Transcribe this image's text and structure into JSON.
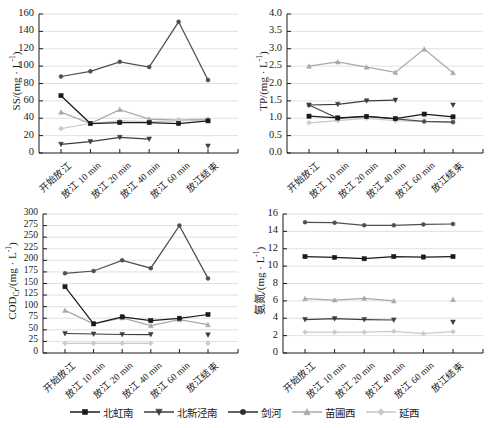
{
  "figure": {
    "panel_count": 4,
    "categories": [
      "开始放江",
      "放江 10 min",
      "放江 20 min",
      "放江 40 min",
      "放江 60 min",
      "放江结束"
    ],
    "series_names": [
      "北虹南",
      "北新泾南",
      "剑河",
      " 苗圃西",
      "延西"
    ],
    "series_colors": [
      "#1a1a1a",
      "#3d3d3d",
      "#4f4f4f",
      "#a8a8a8",
      "#c9c9c9"
    ],
    "series_markers": [
      "square",
      "triangle-down",
      "circle",
      "triangle-up",
      "diamond"
    ]
  },
  "legend": {
    "position": "bottom-center",
    "items": [
      {
        "label": "北虹南",
        "color": "#1a1a1a",
        "marker": "square"
      },
      {
        "label": "北新泾南",
        "color": "#3d3d3d",
        "marker": "triangle-down"
      },
      {
        "label": "剑河",
        "color": "#2e2e2e",
        "marker": "circle"
      },
      {
        "label": "苗圃西",
        "color": "#a8a8a8",
        "marker": "triangle-up"
      },
      {
        "label": "延西",
        "color": "#c9c9c9",
        "marker": "diamond"
      }
    ]
  },
  "chart_data": [
    {
      "id": "ss",
      "type": "line",
      "title": "",
      "xlabel": "",
      "ylabel": "SS/(mg · L⁻¹)",
      "ylabel_main": "SS/(mg · L",
      "ylabel_exp": "-1",
      "ylabel_tail": ")",
      "ylim": [
        0,
        160
      ],
      "yticks": [
        0,
        20,
        40,
        60,
        80,
        100,
        120,
        140,
        160
      ],
      "grid": true,
      "categories": [
        "开始放江",
        "放江 10 min",
        "放江 20 min",
        "放江 40 min",
        "放江 60 min",
        "放江结束"
      ],
      "series": [
        {
          "name": "北虹南",
          "values": [
            66,
            34,
            35,
            35,
            34,
            37
          ]
        },
        {
          "name": "北新泾南",
          "values": [
            10,
            13,
            18,
            16,
            null,
            8
          ]
        },
        {
          "name": "剑河",
          "values": [
            88,
            94,
            105,
            99,
            151,
            84
          ]
        },
        {
          "name": "苗圃西",
          "values": [
            47,
            34,
            50,
            39,
            38,
            39
          ]
        },
        {
          "name": "延西",
          "values": [
            28,
            34,
            37,
            36,
            37,
            38
          ]
        }
      ]
    },
    {
      "id": "tp",
      "type": "line",
      "title": "",
      "xlabel": "",
      "ylabel": "TP/(mg · L⁻¹)",
      "ylabel_main": "TP/(mg · L",
      "ylabel_exp": "-1",
      "ylabel_tail": ")",
      "ylim": [
        0.0,
        4.0
      ],
      "yticks": [
        0.0,
        0.5,
        1.0,
        1.5,
        2.0,
        2.5,
        3.0,
        3.5,
        4.0
      ],
      "ytick_labels": [
        "0.0",
        "0.5",
        "1.0",
        "1.5",
        "2.0",
        "2.5",
        "3.0",
        "3.5",
        "4.0"
      ],
      "grid": true,
      "categories": [
        "开始放江",
        "放江 10 min",
        "放江 20 min",
        "放江 40 min",
        "放江 60 min",
        "放江结束"
      ],
      "series": [
        {
          "name": "北虹南",
          "values": [
            1.06,
            1.01,
            1.05,
            0.99,
            1.12,
            1.04
          ]
        },
        {
          "name": "北新泾南",
          "values": [
            1.38,
            1.4,
            1.5,
            1.52,
            null,
            1.38
          ]
        },
        {
          "name": "剑河",
          "values": [
            1.38,
            1.0,
            1.05,
            0.98,
            0.91,
            0.89
          ]
        },
        {
          "name": "苗圃西",
          "values": [
            2.5,
            2.62,
            2.47,
            2.32,
            2.99,
            2.31
          ]
        },
        {
          "name": "延西",
          "values": [
            0.87,
            0.93,
            1.0,
            0.93,
            0.9,
            0.88
          ]
        }
      ]
    },
    {
      "id": "cod",
      "type": "line",
      "title": "",
      "xlabel": "",
      "ylabel": "CODcr/(mg · L⁻¹)",
      "ylabel_main": "COD",
      "ylabel_sub": "Cr",
      "ylabel_mid": "/(mg · L",
      "ylabel_exp": "-1",
      "ylabel_tail": ")",
      "ylim": [
        0,
        300
      ],
      "yticks": [
        0,
        25,
        50,
        75,
        100,
        125,
        150,
        175,
        200,
        225,
        250,
        275,
        300
      ],
      "grid": true,
      "categories": [
        "开始放江",
        "放江 10 min",
        "放江 20 min",
        "放江 40 min",
        "放江 60 min",
        "放江结束"
      ],
      "series": [
        {
          "name": "北虹南",
          "values": [
            143,
            63,
            78,
            70,
            75,
            83
          ]
        },
        {
          "name": "北新泾南",
          "values": [
            42,
            41,
            40,
            40,
            null,
            39
          ]
        },
        {
          "name": "剑河",
          "values": [
            172,
            177,
            200,
            183,
            275,
            161
          ]
        },
        {
          "name": "苗圃西",
          "values": [
            92,
            63,
            76,
            59,
            72,
            61
          ]
        },
        {
          "name": "延西",
          "values": [
            21,
            21,
            21,
            21,
            null,
            21
          ]
        }
      ]
    },
    {
      "id": "nh",
      "type": "line",
      "title": "",
      "xlabel": "",
      "ylabel": "氨氮/(mg · L⁻¹)",
      "ylabel_main": "氨氮/(mg · L",
      "ylabel_exp": "-1",
      "ylabel_tail": ")",
      "ylim": [
        0,
        16
      ],
      "yticks": [
        0,
        2,
        4,
        6,
        8,
        10,
        12,
        14,
        16
      ],
      "grid": true,
      "categories": [
        "开始放江",
        "放江 10 min",
        "放江 20 min",
        "放江 40 min",
        "放江 60 min",
        "放江结束"
      ],
      "series": [
        {
          "name": "北虹南",
          "values": [
            11.1,
            11.0,
            10.85,
            11.1,
            11.05,
            11.1
          ]
        },
        {
          "name": "北新泾南",
          "values": [
            3.85,
            3.95,
            3.85,
            3.8,
            null,
            3.55
          ]
        },
        {
          "name": "剑河",
          "values": [
            15.05,
            15.0,
            14.7,
            14.7,
            14.8,
            14.85
          ]
        },
        {
          "name": "苗圃西",
          "values": [
            6.25,
            6.1,
            6.3,
            6.0,
            null,
            6.15
          ]
        },
        {
          "name": "延西",
          "values": [
            2.4,
            2.4,
            2.4,
            2.5,
            2.25,
            2.45
          ]
        }
      ]
    }
  ]
}
